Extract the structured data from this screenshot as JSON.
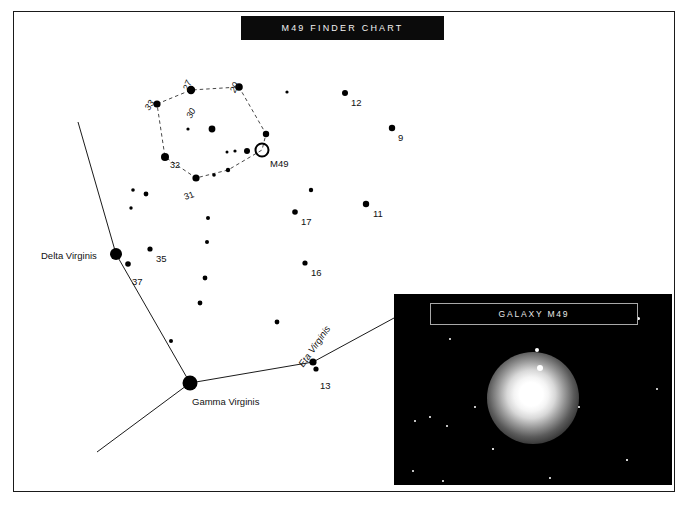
{
  "document": {
    "title": "M49 FINDER CHART",
    "kind": "star-finder-chart"
  },
  "inset": {
    "caption": "GALAXY M49"
  },
  "colors": {
    "background": "#ffffff",
    "ink": "#000000",
    "banner_background": "#0b0b0b",
    "banner_text": "#f2f2f2",
    "photo_background": "#000000",
    "caption_border": "#a8a8a8",
    "dashed_line": "#333333"
  },
  "named_stars": [
    {
      "name": "Delta Virginis",
      "x": 116,
      "y": 254,
      "radius": 6.0,
      "label_x": 41,
      "label_y": 250
    },
    {
      "name": "Gamma Virginis",
      "x": 190,
      "y": 383,
      "radius": 7.5,
      "label_x": 192,
      "label_y": 396
    },
    {
      "name": "Eta Virginis",
      "x": 313,
      "y": 362,
      "radius": 3.6,
      "label_x": 305,
      "label_y": 358
    }
  ],
  "deep_sky_object": {
    "designation": "M49",
    "marker": "open-circle",
    "x": 262,
    "y": 150,
    "radius": 6.5,
    "label_x": 270,
    "label_y": 158
  },
  "numbered_stars": [
    {
      "label": "12",
      "x": 345,
      "y": 93,
      "radius": 3.0,
      "label_x": 351,
      "label_y": 97
    },
    {
      "label": "9",
      "x": 392,
      "y": 128,
      "radius": 3.2,
      "label_x": 398,
      "label_y": 132
    },
    {
      "label": "11",
      "x": 366,
      "y": 204,
      "radius": 3.2,
      "label_x": 373,
      "label_y": 208
    },
    {
      "label": "17",
      "x": 295,
      "y": 212,
      "radius": 2.8,
      "label_x": 301,
      "label_y": 216
    },
    {
      "label": "16",
      "x": 305,
      "y": 263,
      "radius": 2.6,
      "label_x": 311,
      "label_y": 267
    },
    {
      "label": "35",
      "x": 150,
      "y": 249,
      "radius": 2.6,
      "label_x": 156,
      "label_y": 253
    },
    {
      "label": "37",
      "x": 128,
      "y": 264,
      "radius": 2.8,
      "label_x": 132,
      "label_y": 276
    },
    {
      "label": "13",
      "x": 316,
      "y": 369,
      "radius": 2.6,
      "label_x": 320,
      "label_y": 380
    }
  ],
  "polygon_stars": [
    {
      "label": "33",
      "x": 157,
      "y": 104,
      "radius": 3.6,
      "label_x": 151,
      "label_y": 102
    },
    {
      "label": "27",
      "x": 191,
      "y": 90,
      "radius": 4.2,
      "label_x": 190,
      "label_y": 82
    },
    {
      "label": "30",
      "x": 191,
      "y": 90,
      "radius": 0.0,
      "label_x": 193,
      "label_y": 110
    },
    {
      "label": "20",
      "x": 239,
      "y": 87,
      "radius": 3.8,
      "label_x": 237,
      "label_y": 84
    },
    {
      "label": "32",
      "x": 165,
      "y": 157,
      "radius": 4.0,
      "label_x": 170,
      "label_y": 160
    },
    {
      "label": "31",
      "x": 196,
      "y": 178,
      "radius": 3.6,
      "label_x": 186,
      "label_y": 192
    }
  ],
  "polygon_path": [
    [
      157,
      104
    ],
    [
      191,
      90
    ],
    [
      239,
      87
    ],
    [
      266,
      134
    ],
    [
      262,
      150
    ],
    [
      228,
      170
    ],
    [
      196,
      178
    ],
    [
      165,
      157
    ],
    [
      157,
      104
    ]
  ],
  "plain_stars": [
    {
      "x": 188,
      "y": 129,
      "radius": 1.6
    },
    {
      "x": 212,
      "y": 129,
      "radius": 3.4
    },
    {
      "x": 247,
      "y": 151,
      "radius": 3.0
    },
    {
      "x": 235,
      "y": 151,
      "radius": 1.6
    },
    {
      "x": 227,
      "y": 152,
      "radius": 1.5
    },
    {
      "x": 266,
      "y": 134,
      "radius": 3.2
    },
    {
      "x": 228,
      "y": 170,
      "radius": 2.2
    },
    {
      "x": 214,
      "y": 175,
      "radius": 1.8
    },
    {
      "x": 133,
      "y": 190,
      "radius": 1.8
    },
    {
      "x": 146,
      "y": 194,
      "radius": 2.4
    },
    {
      "x": 131,
      "y": 208,
      "radius": 1.7
    },
    {
      "x": 208,
      "y": 218,
      "radius": 2.0
    },
    {
      "x": 207,
      "y": 242,
      "radius": 2.0
    },
    {
      "x": 205,
      "y": 278,
      "radius": 2.4
    },
    {
      "x": 200,
      "y": 303,
      "radius": 2.4
    },
    {
      "x": 171,
      "y": 341,
      "radius": 2.0
    },
    {
      "x": 277,
      "y": 322,
      "radius": 2.4
    },
    {
      "x": 311,
      "y": 190,
      "radius": 2.2
    },
    {
      "x": 287,
      "y": 92,
      "radius": 1.6
    }
  ],
  "constellation_lines": [
    {
      "from": [
        78,
        122
      ],
      "to": [
        116,
        254
      ]
    },
    {
      "from": [
        116,
        254
      ],
      "to": [
        190,
        383
      ]
    },
    {
      "from": [
        190,
        383
      ],
      "to": [
        97,
        452
      ]
    },
    {
      "from": [
        190,
        383
      ],
      "to": [
        313,
        362
      ]
    },
    {
      "from": [
        313,
        362
      ],
      "to": [
        394,
        318
      ]
    }
  ],
  "inset_field_stars": [
    {
      "x": 141,
      "y": 54,
      "size": 4.2
    },
    {
      "x": 243,
      "y": 23,
      "size": 3.4
    },
    {
      "x": 55,
      "y": 44,
      "size": 2.0
    },
    {
      "x": 262,
      "y": 94,
      "size": 2.4
    },
    {
      "x": 184,
      "y": 112,
      "size": 2.0
    },
    {
      "x": 80,
      "y": 112,
      "size": 1.8
    },
    {
      "x": 20,
      "y": 126,
      "size": 2.0
    },
    {
      "x": 35,
      "y": 122,
      "size": 1.8
    },
    {
      "x": 52,
      "y": 131,
      "size": 2.0
    },
    {
      "x": 18,
      "y": 176,
      "size": 2.4
    },
    {
      "x": 48,
      "y": 186,
      "size": 1.8
    },
    {
      "x": 155,
      "y": 183,
      "size": 1.8
    },
    {
      "x": 232,
      "y": 165,
      "size": 1.6
    },
    {
      "x": 98,
      "y": 154,
      "size": 1.6
    }
  ]
}
